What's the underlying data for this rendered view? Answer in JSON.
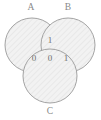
{
  "figure": {
    "type": "venn-diagram",
    "set_count": 3,
    "background_color": "#ffffff",
    "fill_color": "#f2f2f2",
    "hatch_color": "#e3e3e3",
    "outline_color": "#9a9a9a",
    "label_color": "#8a8a8a",
    "value_color": "#6e6e6e"
  },
  "sets": [
    {
      "id": "A",
      "label": "A",
      "label_x": 31,
      "label_y": 8,
      "cx": 32,
      "cy": 45,
      "r": 27
    },
    {
      "id": "B",
      "label": "B",
      "label_x": 68,
      "label_y": 8,
      "cx": 68,
      "cy": 45,
      "r": 27
    },
    {
      "id": "C",
      "label": "C",
      "label_x": 50,
      "label_y": 112,
      "cx": 50,
      "cy": 76,
      "r": 27
    }
  ],
  "regions": [
    {
      "id": "AB",
      "label": "1",
      "description": "A and B only",
      "x": 50,
      "y": 41
    },
    {
      "id": "AC",
      "label": "0",
      "description": "A and C only",
      "x": 34,
      "y": 59
    },
    {
      "id": "ABC",
      "label": "0",
      "description": "A and B and C",
      "x": 50,
      "y": 59
    },
    {
      "id": "BC",
      "label": "1",
      "description": "B and C only",
      "x": 66,
      "y": 59
    }
  ]
}
